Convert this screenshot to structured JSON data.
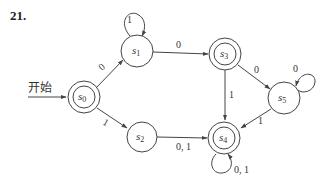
{
  "problem_number": "21.",
  "start_label": "开始",
  "colors": {
    "stroke": "#444444",
    "text": "#333333",
    "background": "#ffffff"
  },
  "states": [
    {
      "id": "s0",
      "name": "s",
      "sub": "0",
      "accepting": true,
      "start": true
    },
    {
      "id": "s1",
      "name": "s",
      "sub": "1",
      "accepting": false
    },
    {
      "id": "s2",
      "name": "s",
      "sub": "2",
      "accepting": false
    },
    {
      "id": "s3",
      "name": "s",
      "sub": "3",
      "accepting": true
    },
    {
      "id": "s4",
      "name": "s",
      "sub": "4",
      "accepting": true
    },
    {
      "id": "s5",
      "name": "s",
      "sub": "5",
      "accepting": false
    }
  ],
  "transitions": [
    {
      "from": "s0",
      "to": "s1",
      "label": "0"
    },
    {
      "from": "s0",
      "to": "s2",
      "label": "1"
    },
    {
      "from": "s1",
      "to": "s1",
      "label": "1"
    },
    {
      "from": "s1",
      "to": "s3",
      "label": "0"
    },
    {
      "from": "s3",
      "to": "s5",
      "label": "0"
    },
    {
      "from": "s3",
      "to": "s4",
      "label": "1"
    },
    {
      "from": "s5",
      "to": "s5",
      "label": "0"
    },
    {
      "from": "s5",
      "to": "s4",
      "label": "1"
    },
    {
      "from": "s2",
      "to": "s4",
      "label": "0, 1"
    },
    {
      "from": "s4",
      "to": "s4",
      "label": "0, 1"
    }
  ]
}
